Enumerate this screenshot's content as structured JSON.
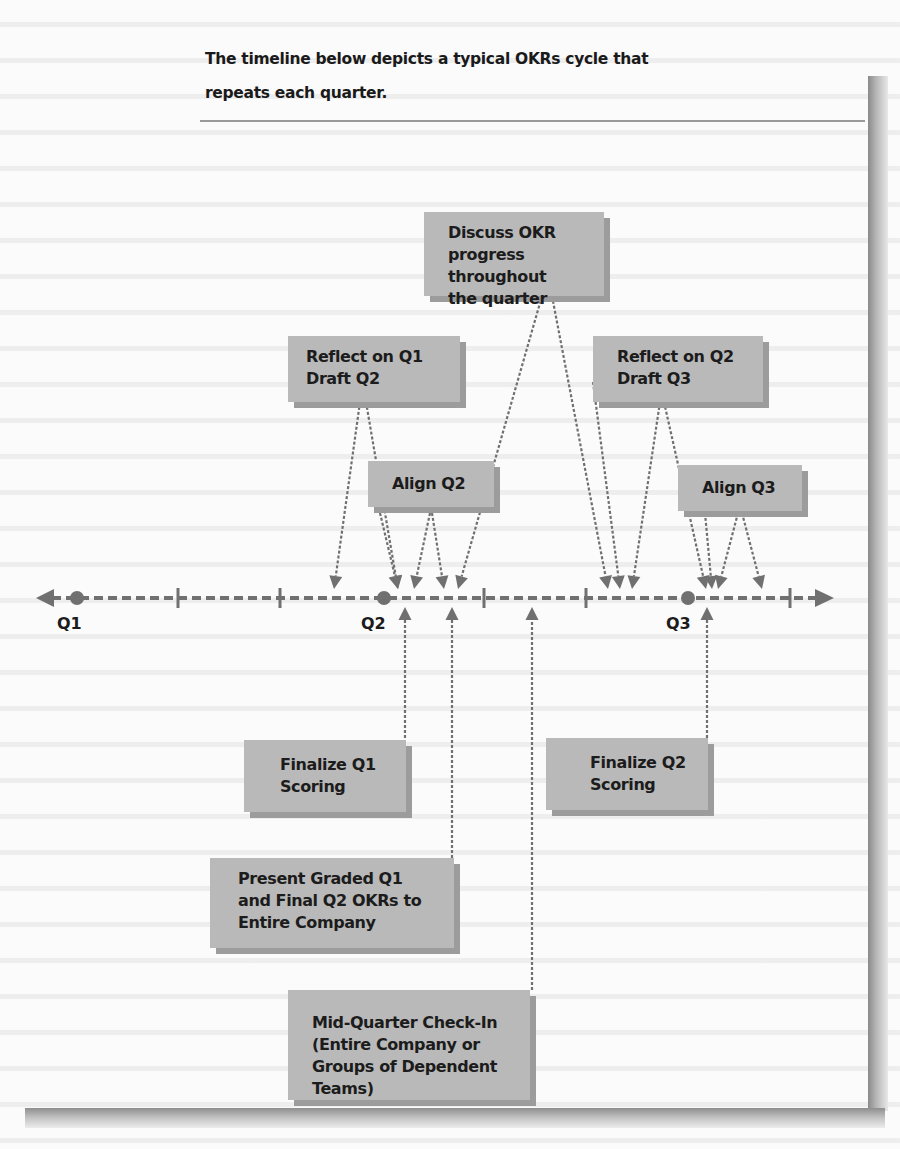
{
  "intro": {
    "line1": "The timeline below depicts a typical OKRs cycle that",
    "line2": "repeats each quarter."
  },
  "timeline": {
    "quarters": [
      "Q1",
      "Q2",
      "Q3"
    ],
    "colors": {
      "box_fill": "#b9b9b9",
      "box_shadow": "#9c9c9c",
      "line": "#707070",
      "text": "#1c1c1c"
    }
  },
  "events": {
    "discuss": "Discuss OKR progress\nthroughout\nthe quarter",
    "reflect_q1": "Reflect on Q1\nDraft Q2",
    "reflect_q2": "Reflect on Q2\nDraft Q3",
    "align_q2": "Align Q2",
    "align_q3": "Align Q3",
    "finalize_q1": "Finalize Q1\nScoring",
    "finalize_q2": "Finalize Q2\nScoring",
    "present": "Present Graded Q1\nand Final Q2 OKRs to\nEntire Company",
    "midquarter": "Mid-Quarter Check-In\n(Entire Company or\nGroups of Dependent\nTeams)"
  }
}
